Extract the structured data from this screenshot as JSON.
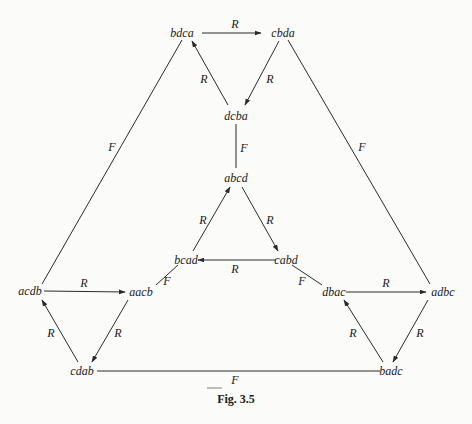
{
  "caption": "Fig. 3.5",
  "caption_underline": true,
  "nodes": {
    "bdca": {
      "label": "bdca",
      "x": 182,
      "y": 37
    },
    "cbda": {
      "label": "cbda",
      "x": 283,
      "y": 37
    },
    "dcba": {
      "label": "dcba",
      "x": 236,
      "y": 120
    },
    "abcd": {
      "label": "abcd",
      "x": 236,
      "y": 182
    },
    "bcad": {
      "label": "bcad",
      "x": 186,
      "y": 264
    },
    "cabd": {
      "label": "cabd",
      "x": 346,
      "y": 264
    },
    "acdb": {
      "label": "acdb",
      "x": 36,
      "y": 295
    },
    "aacb": {
      "label": "aacb",
      "x": 144,
      "y": 296
    },
    "dbac": {
      "label": "dbac",
      "x": 334,
      "y": 296
    },
    "adbc": {
      "label": "adbc",
      "x": 443,
      "y": 296
    },
    "cdab": {
      "label": "cdab",
      "x": 82,
      "y": 375
    },
    "badc": {
      "label": "badc",
      "x": 391,
      "y": 375
    }
  },
  "edges": [
    {
      "from": "bdca",
      "to": "cbda",
      "label": "R",
      "directed": true
    },
    {
      "from": "cbda",
      "to": "dcba",
      "label": "R",
      "directed": true
    },
    {
      "from": "dcba",
      "to": "bdca",
      "label": "R",
      "directed": true
    },
    {
      "from": "dcba",
      "to": "abcd",
      "label": "F",
      "directed": false
    },
    {
      "from": "abcd",
      "to": "cabd",
      "label": "R",
      "directed": true
    },
    {
      "from": "cabd",
      "to": "bcad",
      "label": "R",
      "directed": true
    },
    {
      "from": "bcad",
      "to": "abcd",
      "label": "R",
      "directed": true
    },
    {
      "from": "bcad",
      "to": "aacb",
      "label": "F",
      "directed": false
    },
    {
      "from": "cabd",
      "to": "dbac",
      "label": "F",
      "directed": false
    },
    {
      "from": "acdb",
      "to": "aacb",
      "label": "R",
      "directed": true
    },
    {
      "from": "aacb",
      "to": "cdab",
      "label": "R",
      "directed": true
    },
    {
      "from": "cdab",
      "to": "acdb",
      "label": "R",
      "directed": true
    },
    {
      "from": "dbac",
      "to": "adbc",
      "label": "R",
      "directed": true
    },
    {
      "from": "adbc",
      "to": "badc",
      "label": "R",
      "directed": true
    },
    {
      "from": "badc",
      "to": "dbac",
      "label": "R",
      "directed": true
    },
    {
      "from": "bdca",
      "to": "acdb",
      "label": "F",
      "directed": false
    },
    {
      "from": "cbda",
      "to": "adbc",
      "label": "F",
      "directed": false
    },
    {
      "from": "cdab",
      "to": "badc",
      "label": "F",
      "directed": false
    }
  ],
  "edge_labels": {
    "bdca_cbda": "R",
    "cbda_dcba": "R",
    "dcba_bdca": "R",
    "dcba_abcd": "F",
    "bcad_abcd": "R",
    "abcd_cabd": "R",
    "cabd_bcad": "R",
    "bcad_aacb": "F",
    "cabd_dbac": "F",
    "acdb_aacb": "R",
    "aacb_cdab": "R",
    "cdab_acdb": "R",
    "dbac_adbc": "R",
    "adbc_badc": "R",
    "badc_dbac": "R",
    "bdca_acdb": "F",
    "cbda_adbc": "F",
    "cdab_badc": "F"
  }
}
